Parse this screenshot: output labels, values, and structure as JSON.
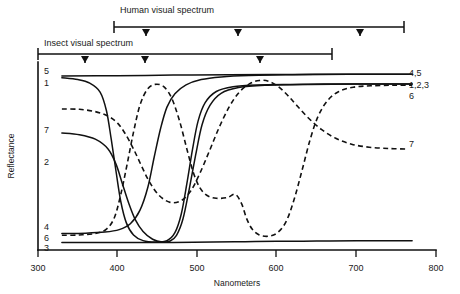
{
  "figure": {
    "caption_present": false,
    "background_color": "#ffffff",
    "ink_color": "#111111"
  },
  "chart_data": {
    "type": "line",
    "title": "",
    "xlabel": "Nanometers",
    "ylabel": "Reflectance",
    "xlim": [
      300,
      800
    ],
    "ylim": [
      0,
      1
    ],
    "grid": false,
    "legend_position": "curve-ends",
    "xticks": [
      300,
      400,
      500,
      600,
      700,
      800
    ],
    "xtick_labels": [
      "300",
      "400",
      "500",
      "600",
      "700",
      "800"
    ],
    "yticks": [],
    "ytick_labels": [],
    "left_labels": [
      "5",
      "1",
      "7",
      "2",
      "4",
      "6",
      "3"
    ],
    "right_labels": [
      "4,5",
      "1,2,3",
      "6",
      "7"
    ],
    "series": [
      {
        "name": "1",
        "style": "solid",
        "left_label": "1",
        "right_label": "1,2,3",
        "points": [
          [
            330,
            0.945
          ],
          [
            350,
            0.935
          ],
          [
            365,
            0.915
          ],
          [
            378,
            0.865
          ],
          [
            386,
            0.76
          ],
          [
            392,
            0.6
          ],
          [
            398,
            0.42
          ],
          [
            404,
            0.25
          ],
          [
            411,
            0.13
          ],
          [
            420,
            0.062
          ],
          [
            432,
            0.03
          ],
          [
            448,
            0.022
          ],
          [
            462,
            0.03
          ],
          [
            472,
            0.075
          ],
          [
            480,
            0.18
          ],
          [
            487,
            0.35
          ],
          [
            494,
            0.54
          ],
          [
            501,
            0.7
          ],
          [
            510,
            0.805
          ],
          [
            524,
            0.868
          ],
          [
            545,
            0.895
          ],
          [
            575,
            0.905
          ],
          [
            620,
            0.908
          ],
          [
            680,
            0.91
          ],
          [
            740,
            0.91
          ],
          [
            770,
            0.91
          ]
        ]
      },
      {
        "name": "2",
        "style": "solid",
        "left_label": "2",
        "right_label": "1,2,3",
        "points": [
          [
            330,
            0.635
          ],
          [
            352,
            0.625
          ],
          [
            372,
            0.6
          ],
          [
            388,
            0.545
          ],
          [
            398,
            0.46
          ],
          [
            406,
            0.35
          ],
          [
            414,
            0.24
          ],
          [
            422,
            0.15
          ],
          [
            432,
            0.082
          ],
          [
            444,
            0.038
          ],
          [
            456,
            0.022
          ],
          [
            466,
            0.028
          ],
          [
            474,
            0.06
          ],
          [
            482,
            0.15
          ],
          [
            490,
            0.32
          ],
          [
            498,
            0.51
          ],
          [
            506,
            0.68
          ],
          [
            516,
            0.79
          ],
          [
            530,
            0.858
          ],
          [
            552,
            0.89
          ],
          [
            585,
            0.903
          ],
          [
            640,
            0.908
          ],
          [
            700,
            0.91
          ],
          [
            770,
            0.91
          ]
        ]
      },
      {
        "name": "3",
        "style": "solid",
        "left_label": "3",
        "right_label": "1,2,3",
        "points": [
          [
            330,
            0.02
          ],
          [
            400,
            0.02
          ],
          [
            470,
            0.02
          ],
          [
            520,
            0.022
          ],
          [
            560,
            0.024
          ],
          [
            600,
            0.026
          ],
          [
            650,
            0.028
          ],
          [
            700,
            0.03
          ],
          [
            770,
            0.03
          ]
        ]
      },
      {
        "name": "4",
        "style": "solid",
        "left_label": "4",
        "right_label": "4,5",
        "points": [
          [
            330,
            0.07
          ],
          [
            360,
            0.072
          ],
          [
            384,
            0.078
          ],
          [
            402,
            0.092
          ],
          [
            416,
            0.125
          ],
          [
            428,
            0.2
          ],
          [
            438,
            0.33
          ],
          [
            446,
            0.5
          ],
          [
            454,
            0.66
          ],
          [
            462,
            0.78
          ],
          [
            472,
            0.855
          ],
          [
            486,
            0.905
          ],
          [
            505,
            0.935
          ],
          [
            530,
            0.95
          ],
          [
            565,
            0.958
          ],
          [
            620,
            0.962
          ],
          [
            690,
            0.965
          ],
          [
            770,
            0.965
          ]
        ]
      },
      {
        "name": "5",
        "style": "solid",
        "left_label": "5",
        "right_label": "4,5",
        "points": [
          [
            330,
            0.955
          ],
          [
            400,
            0.957
          ],
          [
            470,
            0.96
          ],
          [
            540,
            0.962
          ],
          [
            620,
            0.964
          ],
          [
            700,
            0.965
          ],
          [
            770,
            0.965
          ]
        ]
      },
      {
        "name": "6",
        "style": "dashed",
        "left_label": "6",
        "right_label": "6",
        "points": [
          [
            330,
            0.06
          ],
          [
            352,
            0.062
          ],
          [
            372,
            0.07
          ],
          [
            386,
            0.095
          ],
          [
            396,
            0.16
          ],
          [
            404,
            0.29
          ],
          [
            412,
            0.46
          ],
          [
            420,
            0.64
          ],
          [
            428,
            0.79
          ],
          [
            437,
            0.878
          ],
          [
            447,
            0.908
          ],
          [
            458,
            0.895
          ],
          [
            468,
            0.83
          ],
          [
            478,
            0.7
          ],
          [
            487,
            0.545
          ],
          [
            495,
            0.415
          ],
          [
            503,
            0.33
          ],
          [
            512,
            0.285
          ],
          [
            524,
            0.268
          ],
          [
            538,
            0.272
          ],
          [
            548,
            0.29
          ],
          [
            556,
            0.235
          ],
          [
            562,
            0.155
          ],
          [
            569,
            0.095
          ],
          [
            578,
            0.062
          ],
          [
            590,
            0.055
          ],
          [
            601,
            0.075
          ],
          [
            612,
            0.14
          ],
          [
            622,
            0.265
          ],
          [
            632,
            0.43
          ],
          [
            642,
            0.6
          ],
          [
            652,
            0.73
          ],
          [
            664,
            0.818
          ],
          [
            678,
            0.868
          ],
          [
            696,
            0.892
          ],
          [
            718,
            0.9
          ],
          [
            745,
            0.903
          ],
          [
            770,
            0.903
          ]
        ]
      },
      {
        "name": "7",
        "style": "dashed",
        "left_label": "7",
        "right_label": "7",
        "points": [
          [
            330,
            0.77
          ],
          [
            352,
            0.768
          ],
          [
            372,
            0.755
          ],
          [
            388,
            0.73
          ],
          [
            400,
            0.69
          ],
          [
            410,
            0.628
          ],
          [
            420,
            0.545
          ],
          [
            430,
            0.45
          ],
          [
            440,
            0.36
          ],
          [
            452,
            0.285
          ],
          [
            466,
            0.245
          ],
          [
            480,
            0.255
          ],
          [
            492,
            0.31
          ],
          [
            503,
            0.405
          ],
          [
            515,
            0.53
          ],
          [
            527,
            0.66
          ],
          [
            540,
            0.78
          ],
          [
            553,
            0.865
          ],
          [
            566,
            0.912
          ],
          [
            578,
            0.93
          ],
          [
            590,
            0.925
          ],
          [
            602,
            0.895
          ],
          [
            614,
            0.845
          ],
          [
            626,
            0.785
          ],
          [
            640,
            0.718
          ],
          [
            656,
            0.655
          ],
          [
            674,
            0.605
          ],
          [
            694,
            0.572
          ],
          [
            716,
            0.555
          ],
          [
            740,
            0.548
          ],
          [
            762,
            0.545
          ]
        ]
      }
    ],
    "annotations": [
      {
        "name": "human-visual-spectrum",
        "label": "Human visual spectrum",
        "range_nm": [
          400,
          780
        ],
        "marker_nm": [
          440,
          560,
          720
        ]
      },
      {
        "name": "insect-visual-spectrum",
        "label": "Insect visual spectrum",
        "range_nm": [
          300,
          650
        ],
        "marker_nm": [
          360,
          440,
          590
        ]
      }
    ]
  }
}
